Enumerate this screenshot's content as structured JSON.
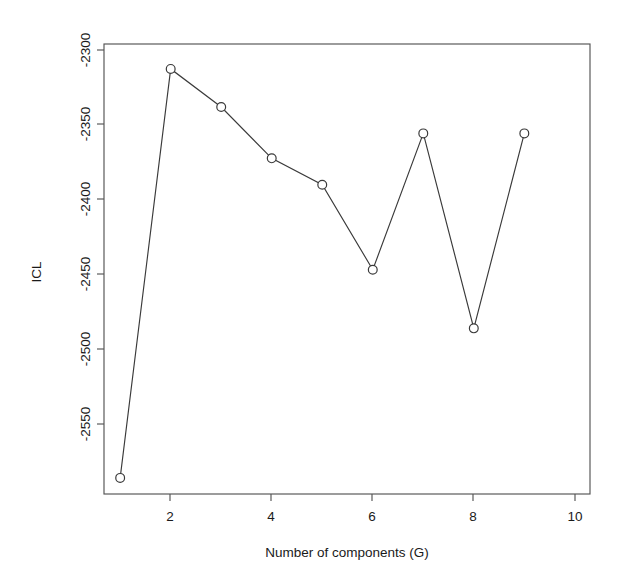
{
  "chart_data": {
    "type": "line",
    "title": "",
    "xlabel": "Number of components (G)",
    "ylabel": "ICL",
    "x": [
      1,
      2,
      3,
      4,
      5,
      6,
      7,
      8,
      9
    ],
    "values": [
      -2586,
      -2307,
      -2333,
      -2368,
      -2386,
      -2444,
      -2351,
      -2484,
      -2351
    ],
    "series": [
      {
        "name": "ICL",
        "x": [
          1,
          2,
          3,
          4,
          5,
          6,
          7,
          8,
          9
        ],
        "values": [
          -2586,
          -2307,
          -2333,
          -2368,
          -2386,
          -2444,
          -2351,
          -2484,
          -2351
        ]
      }
    ],
    "xlim": [
      0.68,
      10.3
    ],
    "ylim": [
      -2597,
      -2290
    ],
    "xticks": [
      2,
      4,
      6,
      8,
      10
    ],
    "xtick_labels": [
      "2",
      "4",
      "6",
      "8",
      "10"
    ],
    "yticks": [
      -2300,
      -2350,
      -2400,
      -2450,
      -2500,
      -2550
    ],
    "ytick_labels": [
      "-2300",
      "-2350",
      "-2400",
      "-2450",
      "-2500",
      "-2550"
    ],
    "grid": false,
    "legend": false,
    "legend_position": "none",
    "marker": "open-circle",
    "line_color": "#3a3a3a",
    "marker_fill": "#ffffff",
    "frame_color": "#545454",
    "background": "#ffffff"
  },
  "axes": {
    "x_title": "Number of components (G)",
    "y_title": "ICL",
    "x_tick_labels": [
      "2",
      "4",
      "6",
      "8",
      "10"
    ],
    "y_tick_labels": [
      "-2300",
      "-2350",
      "-2400",
      "-2450",
      "-2500",
      "-2550"
    ]
  }
}
